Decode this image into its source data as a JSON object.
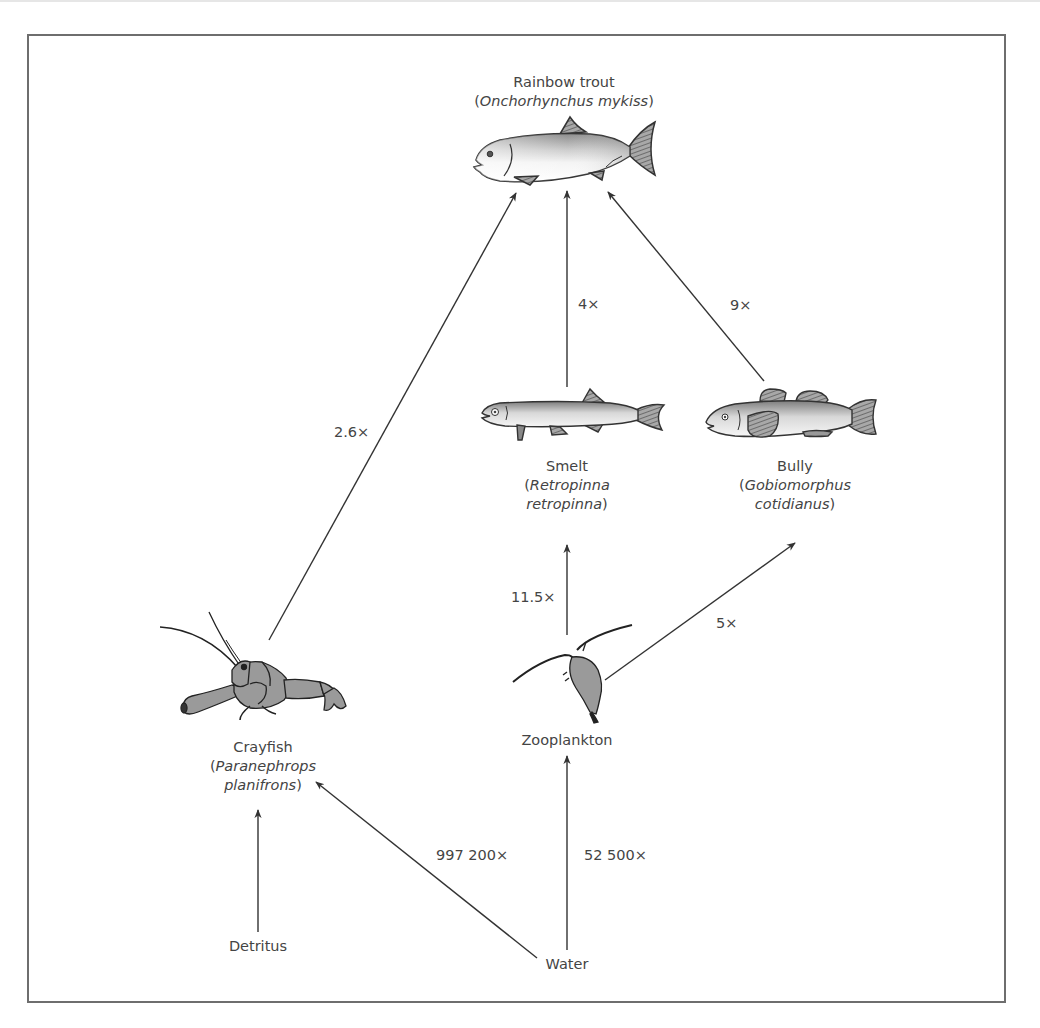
{
  "nodes": {
    "trout": {
      "common": "Rainbow trout",
      "sci_open": "(",
      "sci": "Onchorhynchus mykiss",
      "sci_close": ")"
    },
    "smelt": {
      "common": "Smelt",
      "sci_line1": "Retropinna",
      "sci_line2": "retropinna"
    },
    "bully": {
      "common": "Bully",
      "sci_line1": "Gobiomorphus",
      "sci_line2": "cotidianus"
    },
    "crayfish": {
      "common": "Crayfish",
      "sci_line1": "Paranephrops",
      "sci_line2": "planifrons"
    },
    "zooplankton": {
      "common": "Zooplankton"
    },
    "detritus": {
      "common": "Detritus"
    },
    "water": {
      "common": "Water"
    }
  },
  "edges": [
    {
      "from": "crayfish",
      "to": "trout",
      "factor": "2.6×"
    },
    {
      "from": "smelt",
      "to": "trout",
      "factor": "4×"
    },
    {
      "from": "bully",
      "to": "trout",
      "factor": "9×"
    },
    {
      "from": "zooplankton",
      "to": "smelt",
      "factor": "11.5×"
    },
    {
      "from": "zooplankton",
      "to": "bully",
      "factor": "5×"
    },
    {
      "from": "water",
      "to": "crayfish",
      "factor": "997 200×"
    },
    {
      "from": "water",
      "to": "zooplankton",
      "factor": "52 500×"
    },
    {
      "from": "detritus",
      "to": "crayfish",
      "factor": ""
    }
  ],
  "colors": {
    "line": "#333333",
    "text": "#444444",
    "frame": "#6e6e6e",
    "animal_fill": "#9a9a9a",
    "fin_fill": "#8a8a8a"
  }
}
